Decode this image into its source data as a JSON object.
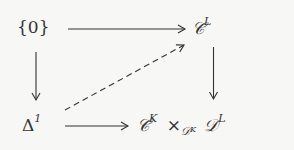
{
  "diagram": {
    "type": "commutative-square",
    "nodes": {
      "top_left": {
        "label": "{0}"
      },
      "top_right": {
        "base": "𝒞",
        "sup": "L"
      },
      "bottom_left": {
        "base": "Δ",
        "sup": "1"
      },
      "bottom_right": {
        "base": "𝒞",
        "sup": "K",
        "times": "×",
        "sub_base": "𝒟",
        "sub_sup": "K",
        "base2": "𝒟",
        "sup2": "L"
      }
    },
    "arrows": [
      {
        "from": "top_left",
        "to": "top_right",
        "style": "solid"
      },
      {
        "from": "top_left",
        "to": "bottom_left",
        "style": "solid"
      },
      {
        "from": "top_right",
        "to": "bottom_right",
        "style": "solid"
      },
      {
        "from": "bottom_left",
        "to": "bottom_right",
        "style": "solid"
      },
      {
        "from": "bottom_left",
        "to": "top_right",
        "style": "dashed"
      }
    ],
    "colors": {
      "ink": "#333333",
      "background": "#f7f7f5"
    }
  }
}
